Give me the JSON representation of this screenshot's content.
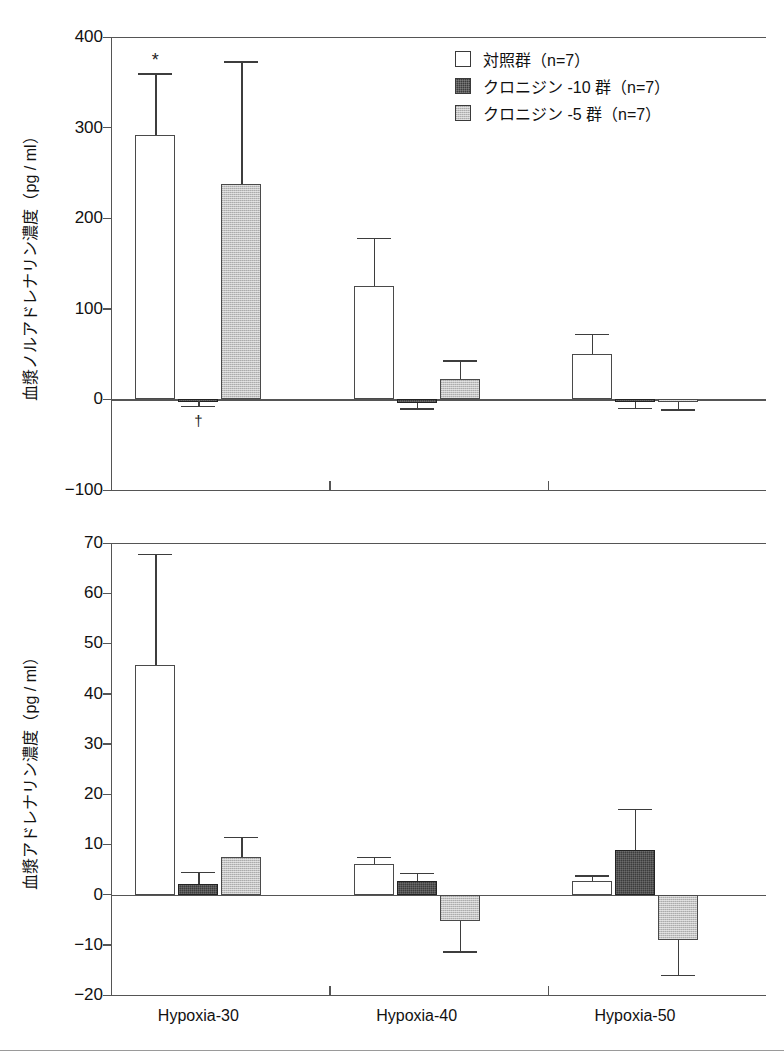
{
  "figure": {
    "xlabels": [
      "Hypoxia-30",
      "Hypoxia-40",
      "Hypoxia-50"
    ],
    "legend": [
      {
        "key": "control",
        "label": "対照群（n=7）",
        "style": "white"
      },
      {
        "key": "clonidine10",
        "label": "クロニジン -10 群（n=7）",
        "style": "dark"
      },
      {
        "key": "clonidine5",
        "label": "クロニジン -5 群（n=7）",
        "style": "gray"
      }
    ],
    "annotations": {
      "asterisk": "*",
      "dagger": "†"
    }
  },
  "chart_data": [
    {
      "id": "plasma-noradrenaline",
      "type": "bar",
      "title": "",
      "xlabel": "",
      "ylabel": "血漿ノルアドレナリン濃度（pg / ml）",
      "ylim": [
        -100,
        400
      ],
      "yticks": [
        400,
        300,
        200,
        100,
        0,
        -100
      ],
      "ytick_labels": [
        "400",
        "300",
        "200",
        "100",
        "0",
        "−100"
      ],
      "categories": [
        "Hypoxia-30",
        "Hypoxia-40",
        "Hypoxia-50"
      ],
      "grid": false,
      "legend_position": "top-right",
      "series": [
        {
          "name": "対照群（n=7）",
          "style": "white",
          "values": [
            292,
            125,
            50
          ],
          "errors": [
            68,
            53,
            22
          ]
        },
        {
          "name": "クロニジン -10 群（n=7）",
          "style": "dark",
          "values": [
            -2,
            -4,
            -3
          ],
          "errors": [
            5,
            6,
            6
          ]
        },
        {
          "name": "クロニジン -5 群（n=7）",
          "style": "gray",
          "values": [
            238,
            22,
            -3
          ],
          "errors": [
            135,
            21,
            8
          ]
        }
      ],
      "marks": [
        {
          "text": "*",
          "series": "control",
          "group": "Hypoxia-30",
          "placement": "above-error"
        },
        {
          "text": "†",
          "series": "clonidine10",
          "group": "Hypoxia-30",
          "placement": "below-error"
        }
      ]
    },
    {
      "id": "plasma-adrenaline",
      "type": "bar",
      "title": "",
      "xlabel": "",
      "ylabel": "血漿アドレナリン濃度（pg / ml）",
      "ylim": [
        -20,
        70
      ],
      "yticks": [
        70,
        60,
        50,
        40,
        30,
        20,
        10,
        0,
        -10,
        -20
      ],
      "ytick_labels": [
        "70",
        "60",
        "50",
        "40",
        "30",
        "20",
        "10",
        "0",
        "−10",
        "−20"
      ],
      "categories": [
        "Hypoxia-30",
        "Hypoxia-40",
        "Hypoxia-50"
      ],
      "grid": false,
      "legend_position": "none",
      "series": [
        {
          "name": "対照群（n=7）",
          "style": "white",
          "values": [
            45.8,
            6.1,
            2.7
          ],
          "errors": [
            22.0,
            1.4,
            1.1
          ]
        },
        {
          "name": "クロニジン -10 群（n=7）",
          "style": "dark",
          "values": [
            2.2,
            2.7,
            8.8
          ],
          "errors": [
            2.3,
            1.6,
            8.2
          ]
        },
        {
          "name": "クロニジン -5 群（n=7）",
          "style": "gray",
          "values": [
            7.5,
            -5.3,
            -9.0
          ],
          "errors": [
            4.0,
            6.0,
            7.0
          ]
        }
      ],
      "marks": []
    }
  ]
}
